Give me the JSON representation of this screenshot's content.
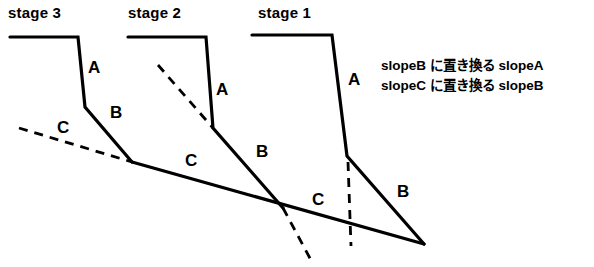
{
  "figure": {
    "background_color": "#ffffff",
    "line_color": "#000000"
  },
  "stage_labels": [
    {
      "name": "stage-3",
      "text": "stage 3",
      "x": 8,
      "y": 4
    },
    {
      "name": "stage-2",
      "text": "stage 2",
      "x": 128,
      "y": 4
    },
    {
      "name": "stage-1",
      "text": "stage 1",
      "x": 258,
      "y": 4
    }
  ],
  "segment_labels": [
    {
      "name": "stage3-slope-a",
      "text": "A",
      "x": 88,
      "y": 58
    },
    {
      "name": "stage3-slope-b",
      "text": "B",
      "x": 110,
      "y": 103
    },
    {
      "name": "stage3-slope-c",
      "text": "C",
      "x": 57,
      "y": 118
    },
    {
      "name": "stage2-slope-a",
      "text": "A",
      "x": 216,
      "y": 80
    },
    {
      "name": "stage2-slope-b",
      "text": "B",
      "x": 256,
      "y": 142
    },
    {
      "name": "stage2-slope-c",
      "text": "C",
      "x": 185,
      "y": 151
    },
    {
      "name": "stage1-slope-a",
      "text": "A",
      "x": 348,
      "y": 70
    },
    {
      "name": "stage1-slope-b",
      "text": "B",
      "x": 397,
      "y": 182
    },
    {
      "name": "stage1-slope-c",
      "text": "C",
      "x": 312,
      "y": 190
    }
  ],
  "notes": [
    {
      "name": "note-slope-a-to-b",
      "text": "slopeB に置き換る slopeA"
    },
    {
      "name": "note-slope-b-to-c",
      "text": "slopeC に置き換る slopeB"
    }
  ],
  "geometry": {
    "solid_polylines": [
      {
        "name": "stage3-profile",
        "points": "10,37 78,37 85,107 132,162"
      },
      {
        "name": "stage2-profile",
        "points": "128,37 206,37 213,128 283,208"
      },
      {
        "name": "stage1-profile",
        "points": "252,35 332,35 347,156 424,244"
      },
      {
        "name": "long-slope-c",
        "points": "132,162 424,244"
      }
    ],
    "dashed_polylines": [
      {
        "name": "stage3-dashed-slope-c",
        "points": "19,128 132,162"
      },
      {
        "name": "stage2-dashed-slope",
        "points": "158,65 213,128"
      },
      {
        "name": "stage2-dashed-slope-extension",
        "points": "283,208 312,262"
      },
      {
        "name": "stage1-dashed-vertical",
        "points": "348,162 351,246"
      }
    ],
    "stroke_width_solid": 3.2,
    "stroke_width_dashed": 2.8,
    "dash_pattern": "9,7"
  }
}
